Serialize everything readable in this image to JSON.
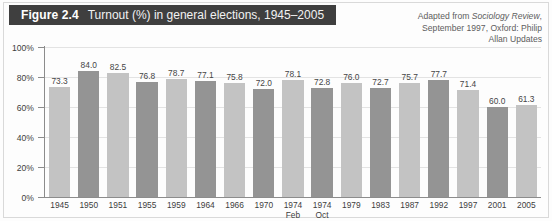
{
  "figure": {
    "label": "Figure 2.4",
    "caption": "Turnout (%) in general elections, 1945–2005"
  },
  "attribution": {
    "line1_prefix": "Adapted from ",
    "line1_source": "Sociology Review",
    "line1_suffix": ",",
    "line2": "September 1997, Oxford: Philip",
    "line3": "Allan Updates"
  },
  "colors": {
    "banner_bg": "#3f3f3f",
    "banner_text": "#ffffff",
    "bar_light": "#c3c3c3",
    "bar_dark": "#949494",
    "axis": "#8c8c8c",
    "grid": "#e3e3e3",
    "text": "#3d3d3d"
  },
  "chart_data": {
    "type": "bar",
    "title": "Turnout (%) in general elections, 1945–2005",
    "xlabel": "",
    "ylabel": "",
    "ylim": [
      0,
      100
    ],
    "yticks": [
      "0%",
      "20%",
      "40%",
      "60%",
      "80%",
      "100%"
    ],
    "ytick_values": [
      0,
      20,
      40,
      60,
      80,
      100
    ],
    "grid": true,
    "legend": "none",
    "categories": [
      "1945",
      "1950",
      "1951",
      "1955",
      "1959",
      "1964",
      "1966",
      "1970",
      "1974",
      "1974",
      "1979",
      "1983",
      "1987",
      "1992",
      "1997",
      "2001",
      "2005"
    ],
    "category_sublabels": [
      "",
      "",
      "",
      "",
      "",
      "",
      "",
      "",
      "Feb",
      "Oct",
      "",
      "",
      "",
      "",
      "",
      "",
      ""
    ],
    "values": [
      73.3,
      84.0,
      82.5,
      76.8,
      78.7,
      77.1,
      75.8,
      72.0,
      78.1,
      72.8,
      76.0,
      72.7,
      75.7,
      77.7,
      71.4,
      60.0,
      61.3
    ],
    "value_labels": [
      "73.3",
      "84.0",
      "82.5",
      "76.8",
      "78.7",
      "77.1",
      "75.8",
      "72.0",
      "78.1",
      "72.8",
      "76.0",
      "72.7",
      "75.7",
      "77.7",
      "71.4",
      "60.0",
      "61.3"
    ],
    "bar_shades": [
      "light",
      "dark",
      "light",
      "dark",
      "light",
      "dark",
      "light",
      "dark",
      "light",
      "dark",
      "light",
      "dark",
      "light",
      "dark",
      "light",
      "dark",
      "light"
    ]
  }
}
